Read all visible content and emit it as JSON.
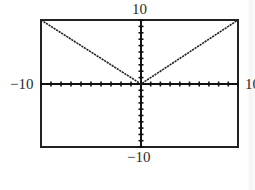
{
  "chart_data": {
    "type": "line",
    "title": "",
    "function": "y = |x|",
    "series": [
      {
        "name": "y = |x|",
        "x": [
          -10,
          0,
          10
        ],
        "y": [
          10,
          0,
          10
        ]
      }
    ],
    "xlim": [
      -10,
      10
    ],
    "ylim": [
      -10,
      10
    ],
    "xscale": 1,
    "yscale": 1,
    "grid": false,
    "axis_labels": {
      "xmin": "−10",
      "xmax": "10",
      "ymin": "−10",
      "ymax": "10"
    },
    "colors": {
      "line": "#222222",
      "frame": "#222222",
      "axes": "#111111"
    }
  }
}
